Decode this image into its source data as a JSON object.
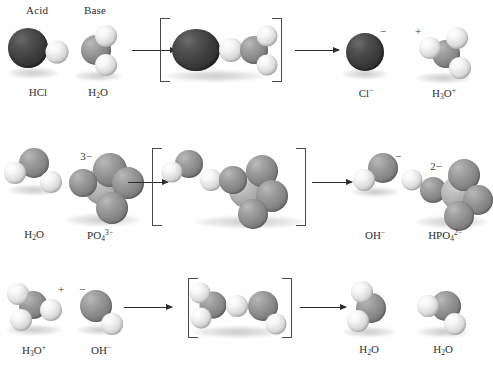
{
  "figure": {
    "background": "#ffffff",
    "width": 483,
    "height": 367
  },
  "headers": [
    {
      "label": "Acid",
      "x": 26,
      "y": 4
    },
    {
      "label": "Base",
      "x": 84,
      "y": 4
    }
  ],
  "colors": {
    "hydrogen": "#f0f0f0",
    "oxygen": "#8a8a8a",
    "phosphorus": "#bdbdbd",
    "chlorine": "#3c3c3c",
    "text": "#2f2f2f",
    "arrow": "#2b2b2b",
    "bracket": "#4a4a4a"
  },
  "rows": [
    {
      "id": "row-1",
      "reactants": [
        {
          "name": "hydrogen-chloride",
          "formula_html": "HCl",
          "caption_x": 38,
          "caption_y": 86,
          "role": "acid"
        },
        {
          "name": "water",
          "formula_html": "H<sub>2</sub>O",
          "caption_x": 98,
          "caption_y": 86,
          "role": "base"
        }
      ],
      "transition_state": {
        "name": "transition-state-complex-1"
      },
      "products": [
        {
          "name": "chloride-ion",
          "formula_html": "Cl<sup>&#8722;</sup>",
          "caption_x": 366,
          "caption_y": 86,
          "charge": "−",
          "charge_x": 383,
          "charge_y": 25
        },
        {
          "name": "hydronium-ion",
          "formula_html": "H<sub>3</sub>O<sup>+</sup>",
          "caption_x": 444,
          "caption_y": 86,
          "charge": "+",
          "charge_x": 418,
          "charge_y": 25
        }
      ]
    },
    {
      "id": "row-2",
      "reactants": [
        {
          "name": "water",
          "formula_html": "H<sub>2</sub>O",
          "caption_x": 34,
          "caption_y": 228,
          "role": "acid"
        },
        {
          "name": "phosphate-ion",
          "formula_html": "PO<sub>4</sub><sup>3&#8722;</sup>",
          "caption_x": 100,
          "caption_y": 228,
          "role": "base",
          "charge": "3−",
          "charge_x": 86,
          "charge_y": 150
        }
      ],
      "transition_state": {
        "name": "transition-state-complex-2"
      },
      "products": [
        {
          "name": "hydroxide-ion",
          "formula_html": "OH<sup>&#8722;</sup>",
          "caption_x": 375,
          "caption_y": 228,
          "charge": "−",
          "charge_x": 398,
          "charge_y": 150
        },
        {
          "name": "hydrogen-phosphate-ion",
          "formula_html": "HPO<sub>4</sub><sup>2&#8722;</sup>",
          "caption_x": 445,
          "caption_y": 228,
          "charge": "2−",
          "charge_x": 436,
          "charge_y": 160
        }
      ]
    },
    {
      "id": "row-3",
      "reactants": [
        {
          "name": "hydronium-ion",
          "formula_html": "H<sub>3</sub>O<sup>+</sup>",
          "caption_x": 34,
          "caption_y": 343,
          "role": "acid",
          "charge": "+",
          "charge_x": 61,
          "charge_y": 283
        },
        {
          "name": "hydroxide-ion",
          "formula_html": "OH<sup>&#8722;</sup>",
          "caption_x": 101,
          "caption_y": 343,
          "role": "base",
          "charge": "−",
          "charge_x": 82,
          "charge_y": 283
        }
      ],
      "transition_state": {
        "name": "transition-state-complex-3"
      },
      "products": [
        {
          "name": "water",
          "formula_html": "H<sub>2</sub>O",
          "caption_x": 369,
          "caption_y": 343
        },
        {
          "name": "water",
          "formula_html": "H<sub>2</sub>O",
          "caption_x": 443,
          "caption_y": 343
        }
      ]
    }
  ],
  "arrows": [
    {
      "name": "reaction-arrow-1a",
      "x": 132,
      "y": 50,
      "width": 44
    },
    {
      "name": "reaction-arrow-1b",
      "x": 295,
      "y": 50,
      "width": 44
    },
    {
      "name": "reaction-arrow-2a",
      "x": 128,
      "y": 182,
      "width": 40
    },
    {
      "name": "reaction-arrow-2b",
      "x": 312,
      "y": 182,
      "width": 40
    },
    {
      "name": "reaction-arrow-3a",
      "x": 124,
      "y": 307,
      "width": 48
    },
    {
      "name": "reaction-arrow-3b",
      "x": 300,
      "y": 307,
      "width": 46
    }
  ],
  "brackets": [
    {
      "name": "bracket-left-1",
      "x": 160,
      "y": 18,
      "width": 9,
      "height": 62,
      "side": "left"
    },
    {
      "name": "bracket-right-1",
      "x": 272,
      "y": 18,
      "width": 9,
      "height": 62,
      "side": "right"
    },
    {
      "name": "bracket-left-2",
      "x": 152,
      "y": 148,
      "width": 9,
      "height": 76,
      "side": "left"
    },
    {
      "name": "bracket-right-2",
      "x": 296,
      "y": 148,
      "width": 9,
      "height": 76,
      "side": "right"
    },
    {
      "name": "bracket-left-3",
      "x": 188,
      "y": 278,
      "width": 9,
      "height": 58,
      "side": "left"
    },
    {
      "name": "bracket-right-3",
      "x": 282,
      "y": 278,
      "width": 9,
      "height": 58,
      "side": "right"
    }
  ]
}
